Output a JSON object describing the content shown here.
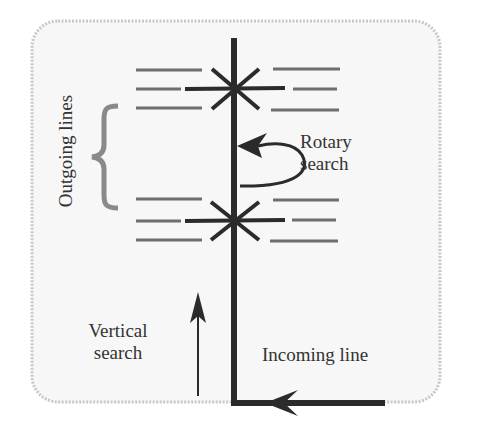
{
  "diagram": {
    "labels": {
      "outgoing_lines": "Outgoing lines",
      "rotary_search": [
        "Rotary",
        "search"
      ],
      "vertical_search": [
        "Vertical",
        "search"
      ],
      "incoming_line": "Incoming line"
    },
    "colors": {
      "background": "#ffffff",
      "panel_fill": "#f7f7f7",
      "panel_border": "#c8c8c8",
      "main_line": "#2b2b2b",
      "outgoing_line": "#6e6e6e",
      "brace": "#8a8a8a",
      "text": "#333333"
    },
    "components": [
      {
        "id": "panel",
        "type": "rounded-rectangle"
      },
      {
        "id": "wiper-shaft",
        "type": "vertical thick line",
        "from": "incoming line",
        "meaning": "vertical movement"
      },
      {
        "id": "upper-bank",
        "type": "contact bank level",
        "outgoing_lines_left": 3,
        "outgoing_lines_right": 3
      },
      {
        "id": "lower-bank",
        "type": "contact bank level",
        "outgoing_lines_left": 3,
        "outgoing_lines_right": 3
      },
      {
        "id": "rotary-arrow",
        "type": "curved arrow",
        "label": "Rotary search"
      },
      {
        "id": "vertical-arrow",
        "type": "straight up arrow",
        "label": "Vertical search"
      },
      {
        "id": "incoming-arrow",
        "type": "left-pointing arrow on incoming line",
        "label": "Incoming line"
      },
      {
        "id": "brace",
        "type": "curly brace",
        "label": "Outgoing lines"
      }
    ]
  }
}
